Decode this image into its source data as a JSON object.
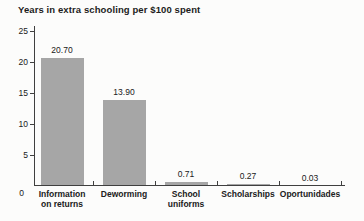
{
  "chart_data": {
    "type": "bar",
    "title": "Years in extra schooling per $100 spent",
    "categories": [
      "Information on returns",
      "Deworming",
      "School uniforms",
      "Scholarships",
      "Oportunidades"
    ],
    "category_lines": [
      [
        "Information",
        "on returns"
      ],
      [
        "Deworming"
      ],
      [
        "School",
        "uniforms"
      ],
      [
        "Scholarships"
      ],
      [
        "Oportunidades"
      ]
    ],
    "values": [
      20.7,
      13.9,
      0.71,
      0.27,
      0.03
    ],
    "value_labels": [
      "20.70",
      "13.90",
      "0.71",
      "0.27",
      "0.03"
    ],
    "xlabel": "",
    "ylabel": "",
    "ylim": [
      0,
      25
    ],
    "yticks": [
      25,
      20,
      15,
      10,
      5,
      0
    ],
    "grid": false,
    "legend_position": "none",
    "colors": {
      "bar": "#a6a6a6",
      "axis": "#3f3f3f",
      "text": "#202020",
      "background": "#fcfcfb"
    }
  }
}
